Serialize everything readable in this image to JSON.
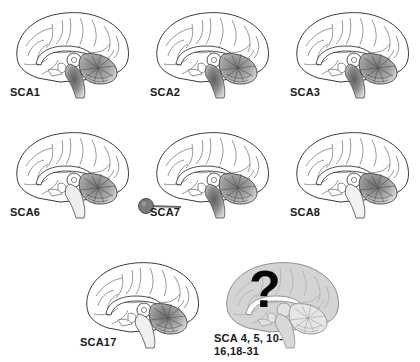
{
  "figure": {
    "background_color": "#ffffff",
    "illustration_type": "mid-sagittal brain diagram grid",
    "panel_count": 8
  },
  "colors": {
    "outline": "#3a3a3a",
    "sulci": "#6b6b6b",
    "cortex_fill": "#ffffff",
    "corpus_callosum": "#ffffff",
    "cerebellum_shade_light": "#c9c9c9",
    "cerebellum_shade_mid": "#9a9a9a",
    "cerebellum_shade_dark": "#6e6e6e",
    "brainstem_shade_dark": "#5f5f5f",
    "brainstem_shade_light": "#bdbdbd",
    "unknown_brain_fill": "#d4d4d4",
    "question_mark": "#050505",
    "eye_fill": "#7a7a7a",
    "label_text": "#1a1a1a"
  },
  "panels": [
    {
      "id": "sca1",
      "label": "SCA1",
      "row": 1,
      "column": 1,
      "affected_regions": [
        "cerebellum",
        "brainstem",
        "pons"
      ],
      "severity": "marked cerebellar and brainstem atrophy",
      "has_eye_symbol": false,
      "has_question_mark": false,
      "brain_greyed_out": false
    },
    {
      "id": "sca2",
      "label": "SCA2",
      "row": 1,
      "column": 2,
      "affected_regions": [
        "cerebellum",
        "brainstem",
        "pons"
      ],
      "severity": "marked cerebellar and brainstem atrophy",
      "has_eye_symbol": false,
      "has_question_mark": false,
      "brain_greyed_out": false
    },
    {
      "id": "sca3",
      "label": "SCA3",
      "row": 1,
      "column": 3,
      "affected_regions": [
        "cerebellum",
        "brainstem",
        "pons"
      ],
      "severity": "marked cerebellar and brainstem atrophy",
      "has_eye_symbol": false,
      "has_question_mark": false,
      "brain_greyed_out": false
    },
    {
      "id": "sca6",
      "label": "SCA6",
      "row": 2,
      "column": 1,
      "affected_regions": [
        "cerebellum"
      ],
      "severity": "isolated cerebellar atrophy",
      "has_eye_symbol": false,
      "has_question_mark": false,
      "brain_greyed_out": false
    },
    {
      "id": "sca7",
      "label": "SCA7",
      "row": 2,
      "column": 2,
      "affected_regions": [
        "cerebellum",
        "brainstem",
        "retina"
      ],
      "severity": "cerebellar, brainstem and retinal degeneration",
      "has_eye_symbol": true,
      "eye_symbol_name": "retina-eye-icon",
      "has_question_mark": false,
      "brain_greyed_out": false
    },
    {
      "id": "sca8",
      "label": "SCA8",
      "row": 2,
      "column": 3,
      "affected_regions": [
        "cerebellum"
      ],
      "severity": "cerebellar atrophy",
      "has_eye_symbol": false,
      "has_question_mark": false,
      "brain_greyed_out": false
    },
    {
      "id": "sca17",
      "label": "SCA17",
      "row": 3,
      "column": 1,
      "affected_regions": [
        "cerebellum"
      ],
      "severity": "cerebellar atrophy",
      "has_eye_symbol": false,
      "has_question_mark": false,
      "brain_greyed_out": false
    },
    {
      "id": "sca-unknown",
      "label": "SCA 4, 5, 10-\n16,18-31",
      "label_line1": "SCA 4, 5, 10-",
      "label_line2": "16,18-31",
      "row": 3,
      "column": 2,
      "affected_regions": [
        "unknown"
      ],
      "severity": "pattern unknown",
      "has_eye_symbol": false,
      "has_question_mark": true,
      "question_mark_glyph": "?",
      "brain_greyed_out": true
    }
  ]
}
